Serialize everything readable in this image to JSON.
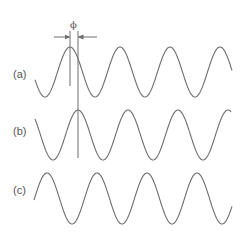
{
  "diagram": {
    "stroke_color": "#6e6e6e",
    "background": "#ffffff",
    "phase_symbol": "ϕ",
    "waves": [
      {
        "label": "(a)",
        "label_x": 13,
        "label_y": 69,
        "center_y": 72,
        "amplitude": 25,
        "period": 50,
        "peak_x": 70,
        "x_start": 35,
        "x_end": 232
      },
      {
        "label": "(b)",
        "label_x": 13,
        "label_y": 126,
        "center_y": 135,
        "amplitude": 25,
        "period": 50,
        "peak_x": 78,
        "x_start": 35,
        "x_end": 231
      },
      {
        "label": "(c)",
        "label_x": 13,
        "label_y": 185,
        "center_y": 198.5,
        "amplitude": 25.5,
        "period": 50,
        "peak_x": 47,
        "x_start": 34,
        "x_end": 232
      }
    ],
    "phase_marker": {
      "left_line_x": 70,
      "left_line_y1": 31,
      "left_line_y2": 86,
      "right_line_x": 78,
      "right_line_y1": 31,
      "right_line_y2": 158,
      "arrow_y": 37,
      "left_arrow_from": 54,
      "right_arrow_from": 97,
      "symbol_x": 70,
      "symbol_y": 20
    }
  }
}
